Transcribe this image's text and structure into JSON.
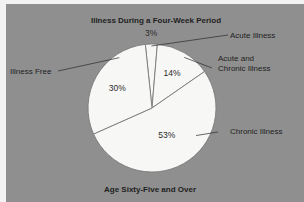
{
  "chart_data": {
    "type": "pie",
    "title": "Illness During a Four-Week Period",
    "subtitle": "Age Sixty-Five and Over",
    "unit": "%",
    "slices": [
      {
        "name": "Acute Illness",
        "value": 3,
        "label": "3%",
        "legend_lines": [
          "Acute Illness"
        ]
      },
      {
        "name": "Acute and Chronic Illness",
        "value": 14,
        "label": "14%",
        "legend_lines": [
          "Acute and",
          "Chronic Illness"
        ]
      },
      {
        "name": "Chronic Illness",
        "value": 53,
        "label": "53%",
        "legend_lines": [
          "Chronic Illness"
        ]
      },
      {
        "name": "Illness Free",
        "value": 30,
        "label": "30%",
        "legend_lines": [
          "Illness Free"
        ]
      }
    ],
    "colors": {
      "background": "#8f8f8f",
      "slice_fill": "#f7f7f5",
      "slice_edge": "#7a7a7a",
      "text": "#1e1e1e"
    }
  }
}
